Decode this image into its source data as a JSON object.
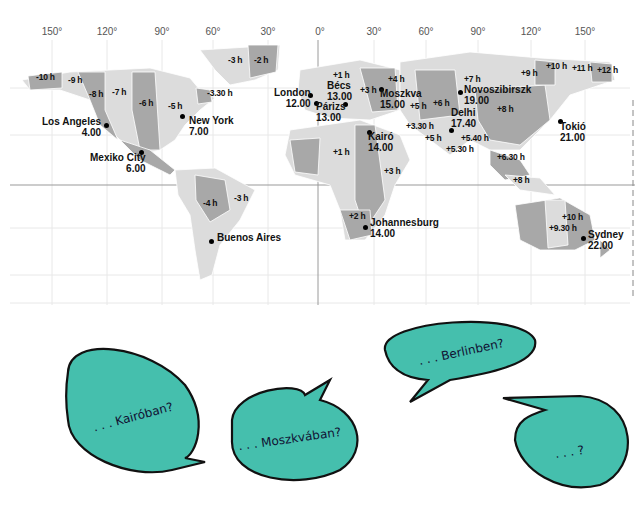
{
  "map": {
    "longitude_labels": [
      {
        "label": "150°",
        "x": 52
      },
      {
        "label": "120°",
        "x": 107
      },
      {
        "label": "90°",
        "x": 162
      },
      {
        "label": "60°",
        "x": 213
      },
      {
        "label": "30°",
        "x": 268
      },
      {
        "label": "0°",
        "x": 320
      },
      {
        "label": "30°",
        "x": 374
      },
      {
        "label": "60°",
        "x": 426
      },
      {
        "label": "90°",
        "x": 478
      },
      {
        "label": "120°",
        "x": 531
      },
      {
        "label": "150°",
        "x": 585
      }
    ],
    "time_offsets": [
      {
        "label": "-10 h",
        "x": 36,
        "y": 77
      },
      {
        "label": "-9 h",
        "x": 68,
        "y": 80
      },
      {
        "label": "-8 h",
        "x": 89,
        "y": 94
      },
      {
        "label": "-7 h",
        "x": 112,
        "y": 92
      },
      {
        "label": "-6 h",
        "x": 139,
        "y": 103
      },
      {
        "label": "-5 h",
        "x": 168,
        "y": 106
      },
      {
        "label": "-3.30 h",
        "x": 207,
        "y": 93
      },
      {
        "label": "-3 h",
        "x": 228,
        "y": 60
      },
      {
        "label": "-2 h",
        "x": 254,
        "y": 60
      },
      {
        "label": "+1 h",
        "x": 333,
        "y": 75
      },
      {
        "label": "+3 h",
        "x": 360,
        "y": 90
      },
      {
        "label": "+4 h",
        "x": 388,
        "y": 79
      },
      {
        "label": "+7 h",
        "x": 464,
        "y": 79
      },
      {
        "label": "+9 h",
        "x": 521,
        "y": 73
      },
      {
        "label": "+10 h",
        "x": 546,
        "y": 66
      },
      {
        "label": "+11 h",
        "x": 572,
        "y": 68
      },
      {
        "label": "+12 h",
        "x": 597,
        "y": 70
      },
      {
        "label": "+5 h",
        "x": 410,
        "y": 106
      },
      {
        "label": "+6 h",
        "x": 433,
        "y": 103
      },
      {
        "label": "+8 h",
        "x": 497,
        "y": 109
      },
      {
        "label": "+3.30 h",
        "x": 406,
        "y": 126
      },
      {
        "label": "+5 h",
        "x": 425,
        "y": 138
      },
      {
        "label": "+5.40 h",
        "x": 461,
        "y": 138
      },
      {
        "label": "+5.30 h",
        "x": 446,
        "y": 149
      },
      {
        "label": "+6.30 h",
        "x": 497,
        "y": 157
      },
      {
        "label": "+8 h",
        "x": 513,
        "y": 180
      },
      {
        "label": "+1 h",
        "x": 333,
        "y": 152
      },
      {
        "label": "+3 h",
        "x": 384,
        "y": 171
      },
      {
        "label": "-4 h",
        "x": 203,
        "y": 203
      },
      {
        "label": "-3 h",
        "x": 234,
        "y": 198
      },
      {
        "label": "+2 h",
        "x": 349,
        "y": 216
      },
      {
        "label": "+10 h",
        "x": 562,
        "y": 217
      },
      {
        "label": "+9.30 h",
        "x": 549,
        "y": 228
      }
    ],
    "cities": [
      {
        "name": "Los Angeles",
        "time": "4.00",
        "x": 42,
        "y": 122,
        "dotx": 106,
        "doty": 125,
        "align": "right"
      },
      {
        "name": "New York",
        "time": "7.00",
        "x": 189,
        "y": 121,
        "dotx": 182,
        "doty": 116,
        "align": "left"
      },
      {
        "name": "Mexiko City",
        "time": "6.00",
        "x": 90,
        "y": 158,
        "dotx": 141,
        "doty": 152,
        "align": "right"
      },
      {
        "name": "London",
        "time": "12.00",
        "x": 274,
        "y": 93,
        "dotx": 310,
        "doty": 95,
        "align": "right"
      },
      {
        "name": "Bécs",
        "time": "13.00",
        "x": 327,
        "y": 86,
        "dotx": 345,
        "doty": 104,
        "align": "left"
      },
      {
        "name": "Párizs",
        "time": "13.00",
        "x": 316,
        "y": 107,
        "dotx": 316,
        "doty": 103,
        "align": "left"
      },
      {
        "name": "Moszkva",
        "time": "15.00",
        "x": 380,
        "y": 94,
        "dotx": 381,
        "doty": 89,
        "align": "left"
      },
      {
        "name": "Novoszibirszk",
        "time": "19.00",
        "x": 464,
        "y": 90,
        "dotx": 460,
        "doty": 92,
        "align": "left"
      },
      {
        "name": "Delhi",
        "time": "17.40",
        "x": 451,
        "y": 113,
        "dotx": 451,
        "doty": 130,
        "align": "left"
      },
      {
        "name": "Tokió",
        "time": "21.00",
        "x": 560,
        "y": 127,
        "dotx": 560,
        "doty": 121,
        "align": "left"
      },
      {
        "name": "Kairó",
        "time": "14.00",
        "x": 368,
        "y": 137,
        "dotx": 369,
        "doty": 132,
        "align": "left"
      },
      {
        "name": "Johannesburg",
        "time": "14.00",
        "x": 370,
        "y": 223,
        "dotx": 365,
        "doty": 227,
        "align": "left"
      },
      {
        "name": "Buenos Aires",
        "time": "",
        "x": 217,
        "y": 238,
        "dotx": 211,
        "doty": 241,
        "align": "left"
      },
      {
        "name": "Sydney",
        "time": "22.00",
        "x": 588,
        "y": 235,
        "dotx": 583,
        "doty": 238,
        "align": "left"
      }
    ],
    "colors": {
      "dark": "#a8a8a8",
      "light": "#dcdcdc",
      "grid": "#e6e6e6",
      "ocean": "#ffffff"
    }
  },
  "bubbles": [
    {
      "text": ". . . Kairóban?",
      "cx": 126,
      "cy": 412
    },
    {
      "text": ". . . Moszkvában?",
      "cx": 290,
      "cy": 435
    },
    {
      "text": ". . . Berlinben?",
      "cx": 458,
      "cy": 352
    },
    {
      "text": ". . . ?",
      "cx": 576,
      "cy": 452
    }
  ],
  "bubble_color": "#45bfad"
}
